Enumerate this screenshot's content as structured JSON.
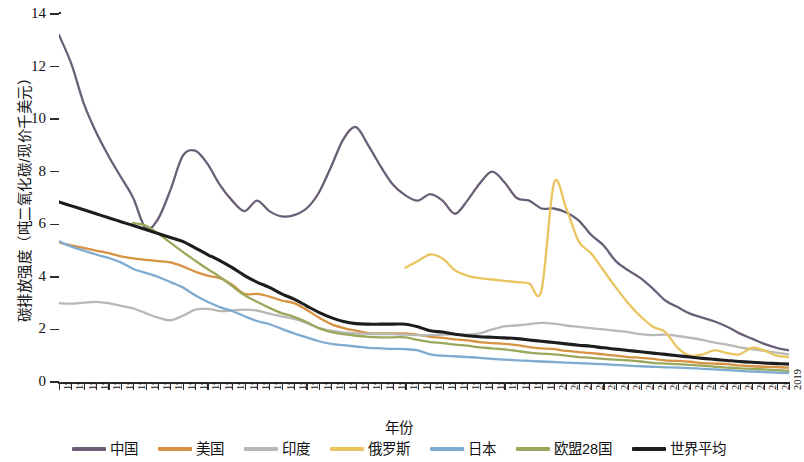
{
  "chart_data": {
    "type": "line",
    "title": "",
    "xlabel": "年份",
    "ylabel": "碳排放强度（吨二氧化碳/现价千美元）",
    "xlim": [
      1960,
      2019
    ],
    "ylim": [
      0,
      14
    ],
    "yticks": [
      0,
      2,
      4,
      6,
      8,
      10,
      12,
      14
    ],
    "ytick_labels": [
      "0",
      "2",
      "4",
      "6",
      "8",
      "10",
      "12",
      "14"
    ],
    "grid": false,
    "legend_position": "bottom",
    "x": [
      1960,
      1961,
      1962,
      1963,
      1964,
      1965,
      1966,
      1967,
      1968,
      1969,
      1970,
      1971,
      1972,
      1973,
      1974,
      1975,
      1976,
      1977,
      1978,
      1979,
      1980,
      1981,
      1982,
      1983,
      1984,
      1985,
      1986,
      1987,
      1988,
      1989,
      1990,
      1991,
      1992,
      1993,
      1994,
      1995,
      1996,
      1997,
      1998,
      1999,
      2000,
      2001,
      2002,
      2003,
      2004,
      2005,
      2006,
      2007,
      2008,
      2009,
      2010,
      2011,
      2012,
      2013,
      2014,
      2015,
      2016,
      2017,
      2018,
      2019
    ],
    "xtick_labels": [
      "1960",
      "1961",
      "1962",
      "1963",
      "1964",
      "1965",
      "1966",
      "1967",
      "1968",
      "1969",
      "1970",
      "1971",
      "1972",
      "1973",
      "1974",
      "1975",
      "1976",
      "1977",
      "1978",
      "1979",
      "1980",
      "1981",
      "1982",
      "1983",
      "1984",
      "1985",
      "1986",
      "1987",
      "1988",
      "1989",
      "1990",
      "1991",
      "1992",
      "1993",
      "1994",
      "1995",
      "1996",
      "1997",
      "1998",
      "1999",
      "2000",
      "2001",
      "2002",
      "2003",
      "2004",
      "2005",
      "2006",
      "2007",
      "2008",
      "2009",
      "2010",
      "2011",
      "2012",
      "2013",
      "2014",
      "2015",
      "2016",
      "2017",
      "2018",
      "2019"
    ],
    "series": [
      {
        "name": "中国",
        "color": "#6b5f78",
        "values": [
          13.2,
          12.1,
          10.6,
          9.5,
          8.6,
          7.8,
          7.0,
          5.85,
          6.2,
          7.3,
          8.6,
          8.8,
          8.3,
          7.5,
          6.9,
          6.5,
          6.9,
          6.5,
          6.3,
          6.35,
          6.6,
          7.2,
          8.2,
          9.25,
          9.7,
          9.0,
          8.2,
          7.5,
          7.1,
          6.9,
          7.15,
          6.9,
          6.4,
          6.9,
          7.55,
          8.0,
          7.6,
          7.0,
          6.9,
          6.6,
          6.6,
          6.45,
          6.15,
          5.6,
          5.2,
          4.6,
          4.25,
          3.95,
          3.55,
          3.1,
          2.85,
          2.6,
          2.45,
          2.3,
          2.1,
          1.85,
          1.65,
          1.45,
          1.3,
          1.2
        ]
      },
      {
        "name": "美国",
        "color": "#d79243",
        "values": [
          5.3,
          5.2,
          5.1,
          5.0,
          4.9,
          4.78,
          4.7,
          4.65,
          4.6,
          4.55,
          4.4,
          4.2,
          4.05,
          3.95,
          3.7,
          3.35,
          3.35,
          3.25,
          3.1,
          3.0,
          2.75,
          2.45,
          2.2,
          2.05,
          1.95,
          1.86,
          1.85,
          1.85,
          1.85,
          1.8,
          1.72,
          1.68,
          1.62,
          1.58,
          1.52,
          1.48,
          1.45,
          1.4,
          1.33,
          1.28,
          1.25,
          1.18,
          1.14,
          1.1,
          1.05,
          1.0,
          0.95,
          0.92,
          0.88,
          0.82,
          0.8,
          0.77,
          0.72,
          0.7,
          0.68,
          0.63,
          0.6,
          0.58,
          0.57,
          0.54
        ]
      },
      {
        "name": "印度",
        "color": "#b8b8b4",
        "values": [
          3.0,
          2.98,
          3.02,
          3.05,
          3.0,
          2.9,
          2.8,
          2.62,
          2.45,
          2.35,
          2.52,
          2.75,
          2.78,
          2.7,
          2.72,
          2.75,
          2.72,
          2.6,
          2.5,
          2.4,
          2.25,
          2.05,
          1.95,
          1.88,
          1.85,
          1.83,
          1.82,
          1.82,
          1.8,
          1.78,
          1.78,
          1.8,
          1.82,
          1.8,
          1.85,
          2.0,
          2.12,
          2.15,
          2.2,
          2.25,
          2.22,
          2.15,
          2.1,
          2.05,
          2.0,
          1.95,
          1.9,
          1.82,
          1.78,
          1.8,
          1.75,
          1.68,
          1.6,
          1.5,
          1.42,
          1.32,
          1.25,
          1.18,
          1.12,
          1.05
        ]
      },
      {
        "name": "俄罗斯",
        "color": "#eac45e",
        "values": [
          null,
          null,
          null,
          null,
          null,
          null,
          null,
          null,
          null,
          null,
          null,
          null,
          null,
          null,
          null,
          null,
          null,
          null,
          null,
          null,
          null,
          null,
          null,
          null,
          null,
          null,
          null,
          null,
          4.35,
          4.6,
          4.85,
          4.7,
          4.25,
          4.05,
          3.95,
          3.9,
          3.85,
          3.8,
          3.75,
          3.5,
          7.55,
          6.6,
          5.35,
          4.9,
          4.25,
          3.6,
          3.0,
          2.5,
          2.1,
          1.9,
          1.3,
          1.0,
          1.05,
          1.2,
          1.1,
          1.05,
          1.3,
          1.2,
          1.0,
          0.95
        ]
      },
      {
        "name": "日本",
        "color": "#7fabd0",
        "values": [
          5.35,
          5.15,
          5.0,
          4.85,
          4.72,
          4.55,
          4.3,
          4.15,
          4.0,
          3.8,
          3.6,
          3.3,
          3.05,
          2.85,
          2.7,
          2.5,
          2.32,
          2.2,
          2.02,
          1.85,
          1.7,
          1.55,
          1.45,
          1.4,
          1.35,
          1.3,
          1.28,
          1.26,
          1.25,
          1.2,
          1.05,
          1.0,
          0.98,
          0.95,
          0.92,
          0.88,
          0.85,
          0.82,
          0.8,
          0.78,
          0.76,
          0.74,
          0.72,
          0.7,
          0.68,
          0.65,
          0.62,
          0.6,
          0.58,
          0.56,
          0.55,
          0.53,
          0.5,
          0.48,
          0.45,
          0.42,
          0.4,
          0.38,
          0.36,
          0.34
        ]
      },
      {
        "name": "欧盟28国",
        "color": "#9aa85c",
        "values": [
          null,
          null,
          null,
          null,
          null,
          null,
          6.05,
          5.95,
          5.65,
          5.3,
          4.95,
          4.62,
          4.3,
          4.0,
          3.65,
          3.3,
          3.05,
          2.82,
          2.62,
          2.48,
          2.28,
          2.05,
          1.9,
          1.82,
          1.76,
          1.72,
          1.7,
          1.7,
          1.7,
          1.6,
          1.52,
          1.48,
          1.42,
          1.38,
          1.32,
          1.28,
          1.24,
          1.18,
          1.12,
          1.08,
          1.05,
          1.0,
          0.95,
          0.92,
          0.88,
          0.85,
          0.82,
          0.78,
          0.73,
          0.7,
          0.68,
          0.65,
          0.62,
          0.58,
          0.55,
          0.52,
          0.5,
          0.48,
          0.45,
          0.42
        ]
      },
      {
        "name": "世界平均",
        "color": "#1d1d1d",
        "values": [
          6.85,
          6.7,
          6.55,
          6.4,
          6.25,
          6.1,
          5.95,
          5.8,
          5.65,
          5.5,
          5.35,
          5.1,
          4.85,
          4.62,
          4.35,
          4.05,
          3.8,
          3.6,
          3.35,
          3.15,
          2.9,
          2.65,
          2.45,
          2.3,
          2.22,
          2.2,
          2.2,
          2.2,
          2.2,
          2.1,
          1.95,
          1.9,
          1.82,
          1.76,
          1.72,
          1.7,
          1.68,
          1.65,
          1.6,
          1.55,
          1.5,
          1.45,
          1.4,
          1.36,
          1.3,
          1.25,
          1.2,
          1.15,
          1.1,
          1.05,
          1.0,
          0.95,
          0.9,
          0.86,
          0.82,
          0.78,
          0.75,
          0.72,
          0.7,
          0.68
        ]
      }
    ]
  }
}
